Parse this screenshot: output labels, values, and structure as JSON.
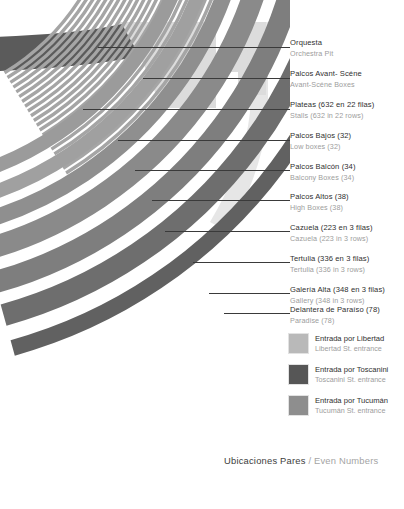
{
  "meta": {
    "background": "#ffffff"
  },
  "footer": {
    "spanish": "Ubicaciones Pares",
    "separator": " / ",
    "english": "Even Numbers"
  },
  "palette": {
    "orchestra_pit": "#5b5b5b",
    "avant_scene": "#dcdcdc",
    "stalls": "#a5a5a5",
    "low_boxes": "#9b9b9b",
    "balcony_boxes": "#a0a0a0",
    "high_boxes": "#8f8f8f",
    "cazuela": "#8a8a8a",
    "tertulia": "#7e7e7e",
    "gallery": "#6e6e6e",
    "paradise": "#616161",
    "leader_line": "#3a3a3a",
    "label_text": "#2f2f2f",
    "label_subtext": "#9d9d9d"
  },
  "callouts": [
    {
      "es": "Orquesta",
      "en": "Orchestra Pit",
      "top": 38,
      "tick_y": 47,
      "leader_y": 47,
      "leader_x": 98,
      "leader_w": 190
    },
    {
      "es": "Palcos Avant- Scéne",
      "en": "Avant-Scéne Boxes",
      "top": 69,
      "tick_y": 78,
      "leader_y": 78,
      "leader_x": 143,
      "leader_w": 145
    },
    {
      "es": "Plateas (632 en 22 filas)",
      "en": "Stalls (632 in 22 rows)",
      "top": 100,
      "tick_y": 109,
      "leader_y": 109,
      "leader_x": 83,
      "leader_w": 205
    },
    {
      "es": "Palcos Bajos (32)",
      "en": "Low boxes (32)",
      "top": 131,
      "tick_y": 140,
      "leader_y": 140,
      "leader_x": 118,
      "leader_w": 170
    },
    {
      "es": "Palcos Balcón (34)",
      "en": "Balcony Boxes (34)",
      "top": 162,
      "tick_y": 170,
      "leader_y": 170,
      "leader_x": 135,
      "leader_w": 153
    },
    {
      "es": "Palcos Altos (38)",
      "en": "High Boxes (38)",
      "top": 192,
      "tick_y": 200,
      "leader_y": 200,
      "leader_x": 152,
      "leader_w": 136
    },
    {
      "es": "Cazuela (223 en 3 filas)",
      "en": "Cazuela (223 in 3 rows)",
      "top": 223,
      "tick_y": 231,
      "leader_y": 231,
      "leader_x": 165,
      "leader_w": 123
    },
    {
      "es": "Tertulia (336 en 3 filas)",
      "en": "Tertulia (336 in 3 rows)",
      "top": 254,
      "tick_y": 262,
      "leader_y": 262,
      "leader_x": 193,
      "leader_w": 95
    },
    {
      "es": "Galería Alta (348 en 3 filas)",
      "en": "Gallery (348 in 3 rows)",
      "top": 285,
      "tick_y": 293,
      "leader_y": 293,
      "leader_x": 209,
      "leader_w": 79
    },
    {
      "es": "Delantera de Paraíso (78)",
      "en": "Paradise (78)",
      "top": 305,
      "tick_y": 313,
      "leader_y": 313,
      "leader_x": 224,
      "leader_w": 64
    }
  ],
  "legend": [
    {
      "es": "Entrada por Libertad",
      "en": "Libertad St. entrance",
      "color": "#b9b9b9",
      "swatch_name": "legend-swatch-libertad"
    },
    {
      "es": "Entrada por Toscanini",
      "en": "Toscanini St. entrance",
      "color": "#565656",
      "swatch_name": "legend-swatch-toscanini"
    },
    {
      "es": "Entrada por Tucumán",
      "en": "Tucumán St. entrance",
      "color": "#8e8e8e",
      "swatch_name": "legend-swatch-tucuman"
    }
  ],
  "plan": {
    "description": "Quarter-circle theatre seating plan, arcs centred off-canvas to the upper-left",
    "center": {
      "x": -120,
      "y": -130
    },
    "stall_rows": 22,
    "bands": [
      {
        "name": "orchestra-pit",
        "radius": 205,
        "thickness": 20,
        "color": "#5b5b5b"
      },
      {
        "name": "avant-scene",
        "radius": 243,
        "thickness": 50,
        "color": "#dcdcdc"
      },
      {
        "name": "stalls",
        "radius": 232,
        "thickness": 120,
        "color": "#a5a5a5"
      },
      {
        "name": "low-boxes",
        "radius": 318,
        "thickness": 14,
        "color": "#9b9b9b"
      },
      {
        "name": "balcony-boxes",
        "radius": 342,
        "thickness": 14,
        "color": "#a0a0a0"
      },
      {
        "name": "high-boxes",
        "radius": 366,
        "thickness": 16,
        "color": "#8f8f8f"
      },
      {
        "name": "cazuela",
        "radius": 394,
        "thickness": 22,
        "color": "#8a8a8a"
      },
      {
        "name": "tertulia",
        "radius": 428,
        "thickness": 22,
        "color": "#7e7e7e"
      },
      {
        "name": "gallery",
        "radius": 462,
        "thickness": 22,
        "color": "#6e6e6e"
      },
      {
        "name": "paradise",
        "radius": 496,
        "thickness": 16,
        "color": "#616161"
      }
    ]
  }
}
